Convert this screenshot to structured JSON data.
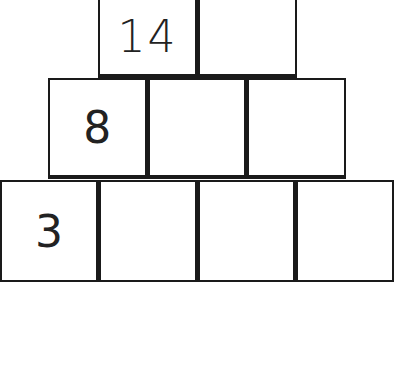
{
  "puzzle": {
    "type": "number pyramid",
    "rows": [
      {
        "cells": [
          "14",
          ""
        ]
      },
      {
        "cells": [
          "8",
          "",
          ""
        ]
      },
      {
        "cells": [
          "3",
          "",
          "",
          ""
        ]
      }
    ]
  }
}
